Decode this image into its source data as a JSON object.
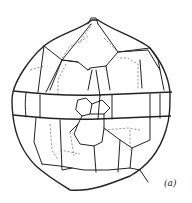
{
  "figure": {
    "panel_label": "(a)",
    "colors": {
      "line": "#222222",
      "background": "#ffffff"
    }
  }
}
